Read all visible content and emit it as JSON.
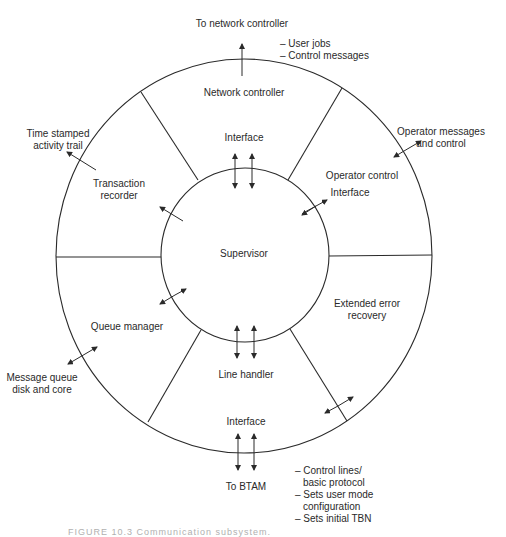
{
  "diagram": {
    "center": {
      "label": "Supervisor"
    },
    "segments": [
      {
        "id": "network-controller",
        "label": "Network controller",
        "interface_label": "Interface"
      },
      {
        "id": "operator-control",
        "label": "Operator control",
        "interface_label": "Interface"
      },
      {
        "id": "extended-error-recovery",
        "label_line1": "Extended error",
        "label_line2": "recovery"
      },
      {
        "id": "line-handler",
        "label": "Line handler",
        "interface_label": "Interface"
      },
      {
        "id": "queue-manager",
        "label": "Queue manager"
      },
      {
        "id": "transaction-recorder",
        "label_line1": "Transaction",
        "label_line2": "recorder"
      }
    ],
    "external": {
      "to_network_controller": "To network controller",
      "network_notes": [
        "– User jobs",
        "– Control messages"
      ],
      "time_stamped_line1": "Time stamped",
      "time_stamped_line2": "activity trail",
      "operator_messages_line1": "Operator messages",
      "operator_messages_line2": "and control",
      "message_queue_line1": "Message queue",
      "message_queue_line2": "disk and core",
      "to_btam": "To BTAM",
      "btam_notes": [
        "– Control lines/",
        "basic protocol",
        "– Sets user mode",
        "configuration",
        "– Sets initial TBN"
      ]
    },
    "caption": "FIGURE 10.3   Communication subsystem."
  },
  "colors": {
    "line": "#2a2a2a",
    "background": "#ffffff"
  }
}
